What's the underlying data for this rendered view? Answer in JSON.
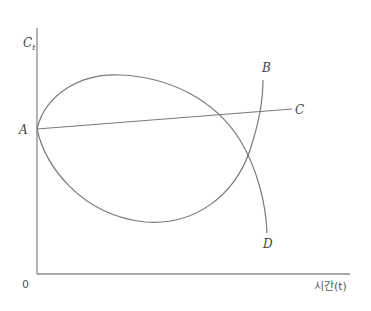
{
  "diagram": {
    "y_axis_label": "C",
    "y_axis_label_sub": "t",
    "x_axis_label": "시간(t)",
    "origin_label": "0",
    "points": {
      "A": "A",
      "B": "B",
      "C": "C",
      "D": "D"
    },
    "curves": [
      {
        "name": "A-to-C",
        "description": "nearly flat, slightly rising straight line from A to C"
      },
      {
        "name": "A-to-B",
        "description": "curve dipping below A to a minimum, then rising steeply to B"
      },
      {
        "name": "A-to-D",
        "description": "curve rising above A to a maximum, then falling steeply to D"
      }
    ]
  }
}
